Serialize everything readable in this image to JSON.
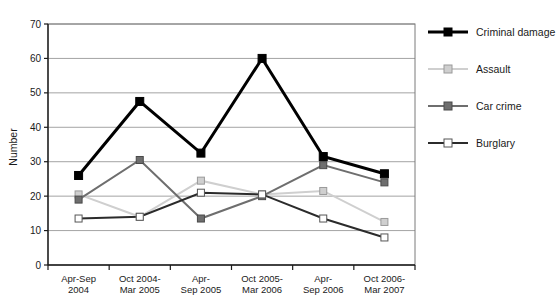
{
  "chart_data": {
    "type": "line",
    "title": "",
    "xlabel": "",
    "ylabel": "Number",
    "ylim": [
      0,
      70
    ],
    "ytick_step": 10,
    "yticks": [
      0,
      10,
      20,
      30,
      40,
      50,
      60,
      70
    ],
    "grid": "horizontal",
    "legend_position": "right",
    "categories": [
      "Apr-Sep\n2004",
      "Oct 2004-\nMar 2005",
      "Apr-\nSep 2005",
      "Oct 2005-\nMar 2006",
      "Apr-\nSep 2006",
      "Oct 2006-\nMar 2007"
    ],
    "series": [
      {
        "name": "Criminal damage",
        "color": "#000000",
        "marker": "filled-square",
        "values": [
          26,
          47.5,
          32.5,
          60,
          31.5,
          26.5
        ]
      },
      {
        "name": "Assault",
        "color": "#cfcfcf",
        "marker": "light-square",
        "values": [
          20.5,
          14,
          24.5,
          20.5,
          21.5,
          12.5
        ]
      },
      {
        "name": "Car crime",
        "color": "#6e6e6e",
        "marker": "dark-square",
        "values": [
          19,
          30.5,
          13.5,
          20,
          29,
          24
        ]
      },
      {
        "name": "Burglary",
        "color": "#2b2b2b",
        "marker": "hollow-square",
        "values": [
          13.5,
          14,
          21,
          20.5,
          13.5,
          8
        ]
      }
    ]
  },
  "axis": {
    "y_title": "Number",
    "ytick_labels": [
      "0",
      "10",
      "20",
      "30",
      "40",
      "50",
      "60",
      "70"
    ],
    "category_lines": [
      [
        "Apr-Sep",
        "2004"
      ],
      [
        "Oct 2004-",
        "Mar 2005"
      ],
      [
        "Apr-",
        "Sep 2005"
      ],
      [
        "Oct 2005-",
        "Mar 2006"
      ],
      [
        "Apr-",
        "Sep 2006"
      ],
      [
        "Oct 2006-",
        "Mar 2007"
      ]
    ]
  },
  "legend": {
    "items": [
      {
        "label": "Criminal damage",
        "color": "#000000",
        "marker": "filled-square"
      },
      {
        "label": "Assault",
        "color": "#cfcfcf",
        "marker": "light-square"
      },
      {
        "label": "Car crime",
        "color": "#6e6e6e",
        "marker": "dark-square"
      },
      {
        "label": "Burglary",
        "color": "#2b2b2b",
        "marker": "hollow-square"
      }
    ]
  },
  "colors": {
    "plot_border": "#7a7a7a",
    "gridline": "#9a9a9a",
    "axis": "#1a1a1a",
    "background": "#ffffff"
  }
}
